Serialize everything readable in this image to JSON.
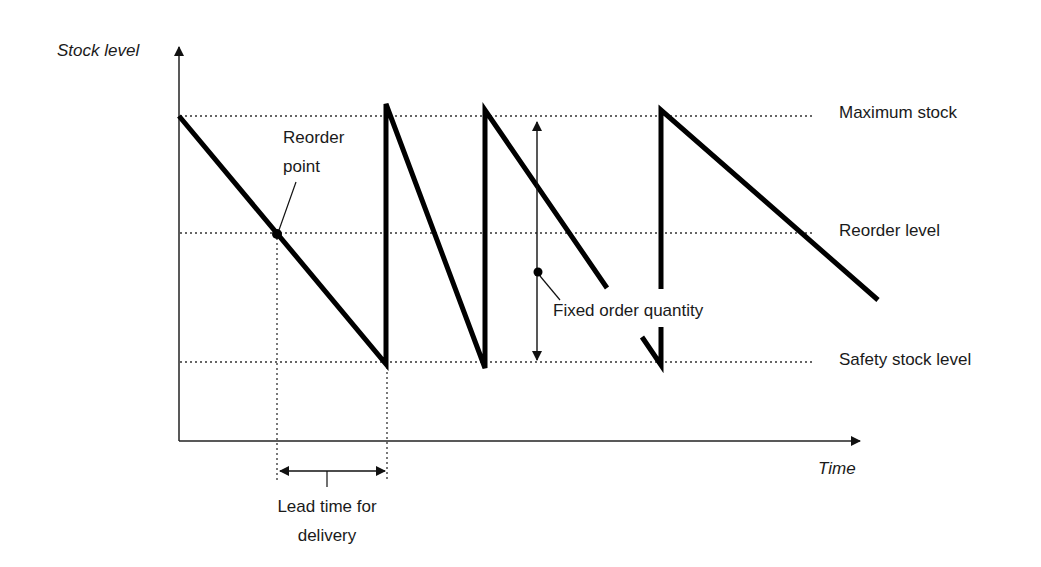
{
  "diagram": {
    "type": "inventory-sawtooth",
    "axes": {
      "y_label": "Stock level",
      "x_label": "Time"
    },
    "levels": [
      {
        "name": "Maximum stock",
        "y": 116
      },
      {
        "name": "Reorder level",
        "y": 233
      },
      {
        "name": "Safety stock level",
        "y": 362
      }
    ],
    "annotations": {
      "reorder_point_line1": "Reorder",
      "reorder_point_line2": "point",
      "fixed_order_quantity": "Fixed order quantity",
      "lead_time_line1": "Lead time for",
      "lead_time_line2": "delivery"
    },
    "colors": {
      "line": "#000000",
      "text": "#1a1a1a",
      "background": "#ffffff"
    }
  }
}
